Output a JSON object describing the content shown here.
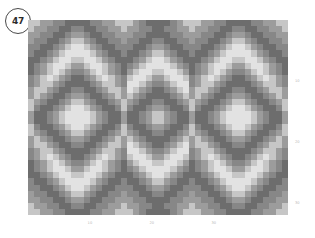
{
  "badge": {
    "label": "47",
    "name": "figure-number-badge"
  },
  "chart_data": {
    "type": "heatmap",
    "title": "",
    "xlabel": "",
    "ylabel": "",
    "grid": false,
    "legend": "none",
    "colormap": "grays",
    "ncols": 42,
    "nrows": 32,
    "xlim": [
      0,
      42
    ],
    "ylim": [
      0,
      32
    ],
    "xticks": [
      10,
      20,
      30
    ],
    "xticklabels": [
      "10",
      "20",
      "30"
    ],
    "yticks": [
      10,
      20,
      30
    ],
    "yticklabels": [
      "10",
      "20",
      "30"
    ],
    "ytick_position": "right",
    "value_levels": [
      0,
      1,
      2,
      3,
      4
    ],
    "level_colors": [
      "#6d6d6d",
      "#878787",
      "#9c9c9c",
      "#c6c6c6",
      "#e2e2e2"
    ],
    "values": [
      [
        3,
        3,
        2,
        2,
        1,
        1,
        0,
        0,
        0,
        0,
        1,
        1,
        2,
        2,
        3,
        3,
        3,
        2,
        1,
        0,
        0,
        0,
        0,
        1,
        2,
        3,
        3,
        3,
        2,
        2,
        1,
        1,
        0,
        0,
        0,
        0,
        1,
        1,
        2,
        2,
        3,
        3
      ],
      [
        3,
        2,
        2,
        1,
        1,
        0,
        0,
        1,
        1,
        0,
        0,
        1,
        1,
        2,
        2,
        3,
        2,
        2,
        1,
        1,
        0,
        0,
        1,
        1,
        2,
        2,
        3,
        2,
        2,
        1,
        1,
        0,
        0,
        1,
        1,
        0,
        0,
        1,
        1,
        2,
        2,
        3
      ],
      [
        2,
        2,
        1,
        1,
        0,
        0,
        1,
        2,
        2,
        1,
        0,
        0,
        1,
        1,
        2,
        2,
        2,
        1,
        1,
        0,
        0,
        0,
        0,
        1,
        1,
        2,
        2,
        2,
        1,
        1,
        0,
        0,
        1,
        2,
        2,
        1,
        0,
        0,
        1,
        1,
        2,
        2
      ],
      [
        2,
        1,
        1,
        0,
        0,
        1,
        2,
        3,
        3,
        2,
        1,
        0,
        0,
        1,
        1,
        2,
        1,
        1,
        0,
        0,
        1,
        1,
        0,
        0,
        1,
        1,
        2,
        1,
        1,
        0,
        0,
        1,
        2,
        3,
        3,
        2,
        1,
        0,
        0,
        1,
        1,
        2
      ],
      [
        1,
        1,
        0,
        0,
        1,
        2,
        3,
        4,
        4,
        3,
        2,
        1,
        0,
        0,
        1,
        1,
        1,
        0,
        0,
        1,
        2,
        2,
        1,
        0,
        0,
        1,
        1,
        1,
        0,
        0,
        1,
        2,
        3,
        4,
        4,
        3,
        2,
        1,
        0,
        0,
        1,
        1
      ],
      [
        1,
        0,
        0,
        1,
        2,
        3,
        4,
        4,
        4,
        4,
        3,
        2,
        1,
        0,
        0,
        1,
        0,
        0,
        1,
        2,
        3,
        3,
        2,
        1,
        0,
        0,
        1,
        0,
        0,
        1,
        2,
        3,
        4,
        4,
        4,
        4,
        3,
        2,
        1,
        0,
        0,
        1
      ],
      [
        0,
        0,
        1,
        2,
        3,
        4,
        4,
        3,
        3,
        4,
        4,
        3,
        2,
        1,
        0,
        0,
        0,
        1,
        2,
        3,
        4,
        4,
        3,
        2,
        1,
        0,
        0,
        0,
        1,
        2,
        3,
        4,
        4,
        3,
        3,
        4,
        4,
        3,
        2,
        1,
        0,
        0
      ],
      [
        0,
        1,
        2,
        3,
        4,
        4,
        3,
        2,
        2,
        3,
        4,
        4,
        3,
        2,
        1,
        0,
        1,
        2,
        3,
        4,
        4,
        4,
        4,
        3,
        2,
        1,
        0,
        1,
        2,
        3,
        4,
        4,
        3,
        2,
        2,
        3,
        4,
        4,
        3,
        2,
        1,
        0
      ],
      [
        0,
        1,
        2,
        3,
        4,
        3,
        2,
        1,
        1,
        2,
        3,
        4,
        3,
        2,
        1,
        0,
        2,
        3,
        4,
        4,
        3,
        3,
        4,
        4,
        3,
        2,
        0,
        1,
        2,
        3,
        4,
        3,
        2,
        1,
        1,
        2,
        3,
        4,
        3,
        2,
        1,
        0
      ],
      [
        1,
        2,
        3,
        4,
        3,
        2,
        1,
        0,
        0,
        1,
        2,
        3,
        4,
        3,
        2,
        1,
        3,
        4,
        4,
        3,
        2,
        2,
        3,
        4,
        4,
        3,
        1,
        2,
        3,
        4,
        3,
        2,
        1,
        0,
        0,
        1,
        2,
        3,
        4,
        3,
        2,
        1
      ],
      [
        1,
        2,
        3,
        3,
        2,
        1,
        0,
        0,
        0,
        0,
        1,
        2,
        3,
        3,
        2,
        1,
        4,
        4,
        3,
        2,
        1,
        1,
        2,
        3,
        4,
        4,
        1,
        2,
        3,
        3,
        2,
        1,
        0,
        0,
        0,
        0,
        1,
        2,
        3,
        3,
        2,
        1
      ],
      [
        2,
        3,
        3,
        2,
        1,
        0,
        0,
        1,
        1,
        0,
        0,
        1,
        2,
        3,
        3,
        2,
        4,
        3,
        2,
        1,
        0,
        0,
        1,
        2,
        3,
        4,
        2,
        3,
        3,
        2,
        1,
        0,
        0,
        1,
        1,
        0,
        0,
        1,
        2,
        3,
        3,
        2
      ],
      [
        2,
        3,
        2,
        1,
        0,
        0,
        1,
        2,
        2,
        1,
        0,
        0,
        1,
        2,
        3,
        2,
        3,
        2,
        1,
        0,
        0,
        0,
        0,
        1,
        2,
        3,
        2,
        3,
        2,
        1,
        0,
        0,
        1,
        2,
        2,
        1,
        0,
        0,
        1,
        2,
        3,
        2
      ],
      [
        3,
        2,
        1,
        0,
        0,
        1,
        2,
        3,
        3,
        2,
        1,
        0,
        0,
        1,
        2,
        3,
        2,
        1,
        0,
        0,
        1,
        1,
        0,
        0,
        1,
        2,
        3,
        2,
        1,
        0,
        0,
        1,
        2,
        3,
        3,
        2,
        1,
        0,
        0,
        1,
        2,
        3
      ],
      [
        3,
        1,
        0,
        0,
        1,
        2,
        3,
        4,
        4,
        3,
        2,
        1,
        0,
        0,
        1,
        3,
        1,
        0,
        0,
        1,
        2,
        2,
        1,
        0,
        0,
        1,
        3,
        1,
        0,
        0,
        1,
        2,
        3,
        4,
        4,
        3,
        2,
        1,
        0,
        0,
        1,
        3
      ],
      [
        2,
        0,
        0,
        1,
        2,
        3,
        4,
        4,
        4,
        4,
        3,
        2,
        1,
        0,
        0,
        2,
        0,
        0,
        1,
        2,
        3,
        3,
        2,
        1,
        0,
        0,
        2,
        0,
        0,
        1,
        2,
        3,
        4,
        4,
        4,
        4,
        3,
        2,
        1,
        0,
        0,
        2
      ],
      [
        2,
        0,
        0,
        1,
        2,
        3,
        4,
        4,
        4,
        4,
        3,
        2,
        1,
        0,
        0,
        2,
        0,
        0,
        1,
        2,
        3,
        3,
        2,
        1,
        0,
        0,
        2,
        0,
        0,
        1,
        2,
        3,
        4,
        4,
        4,
        4,
        3,
        2,
        1,
        0,
        0,
        2
      ],
      [
        3,
        1,
        0,
        0,
        1,
        2,
        3,
        4,
        4,
        3,
        2,
        1,
        0,
        0,
        1,
        3,
        1,
        0,
        0,
        1,
        2,
        2,
        1,
        0,
        0,
        1,
        3,
        1,
        0,
        0,
        1,
        2,
        3,
        4,
        4,
        3,
        2,
        1,
        0,
        0,
        1,
        3
      ],
      [
        3,
        2,
        1,
        0,
        0,
        1,
        2,
        3,
        3,
        2,
        1,
        0,
        0,
        1,
        2,
        3,
        2,
        1,
        0,
        0,
        1,
        1,
        0,
        0,
        1,
        2,
        3,
        2,
        1,
        0,
        0,
        1,
        2,
        3,
        3,
        2,
        1,
        0,
        0,
        1,
        2,
        3
      ],
      [
        2,
        3,
        2,
        1,
        0,
        0,
        1,
        2,
        2,
        1,
        0,
        0,
        1,
        2,
        3,
        2,
        3,
        2,
        1,
        0,
        0,
        0,
        0,
        1,
        2,
        3,
        2,
        3,
        2,
        1,
        0,
        0,
        1,
        2,
        2,
        1,
        0,
        0,
        1,
        2,
        3,
        2
      ],
      [
        2,
        3,
        3,
        2,
        1,
        0,
        0,
        1,
        1,
        0,
        0,
        1,
        2,
        3,
        3,
        2,
        4,
        3,
        2,
        1,
        0,
        0,
        1,
        2,
        3,
        4,
        2,
        3,
        3,
        2,
        1,
        0,
        0,
        1,
        1,
        0,
        0,
        1,
        2,
        3,
        3,
        2
      ],
      [
        1,
        2,
        3,
        3,
        2,
        1,
        0,
        0,
        0,
        0,
        1,
        2,
        3,
        3,
        2,
        1,
        4,
        4,
        3,
        2,
        1,
        1,
        2,
        3,
        4,
        4,
        1,
        2,
        3,
        3,
        2,
        1,
        0,
        0,
        0,
        0,
        1,
        2,
        3,
        3,
        2,
        1
      ],
      [
        1,
        2,
        3,
        4,
        3,
        2,
        1,
        0,
        0,
        1,
        2,
        3,
        4,
        3,
        2,
        1,
        3,
        4,
        4,
        3,
        2,
        2,
        3,
        4,
        4,
        3,
        1,
        2,
        3,
        4,
        3,
        2,
        1,
        0,
        0,
        1,
        2,
        3,
        4,
        3,
        2,
        1
      ],
      [
        0,
        1,
        2,
        3,
        4,
        3,
        2,
        1,
        1,
        2,
        3,
        4,
        3,
        2,
        1,
        0,
        2,
        3,
        4,
        4,
        3,
        3,
        4,
        4,
        3,
        2,
        0,
        1,
        2,
        3,
        4,
        3,
        2,
        1,
        1,
        2,
        3,
        4,
        3,
        2,
        1,
        0
      ],
      [
        0,
        1,
        2,
        3,
        4,
        4,
        3,
        2,
        2,
        3,
        4,
        4,
        3,
        2,
        1,
        0,
        1,
        2,
        3,
        4,
        4,
        4,
        4,
        3,
        2,
        1,
        0,
        1,
        2,
        3,
        4,
        4,
        3,
        2,
        2,
        3,
        4,
        4,
        3,
        2,
        1,
        0
      ],
      [
        0,
        0,
        1,
        2,
        3,
        4,
        4,
        3,
        3,
        4,
        4,
        3,
        2,
        1,
        0,
        0,
        0,
        1,
        2,
        3,
        4,
        4,
        3,
        2,
        1,
        0,
        0,
        0,
        1,
        2,
        3,
        4,
        4,
        3,
        3,
        4,
        4,
        3,
        2,
        1,
        0,
        0
      ],
      [
        1,
        0,
        0,
        1,
        2,
        3,
        4,
        4,
        4,
        4,
        3,
        2,
        1,
        0,
        0,
        1,
        0,
        0,
        1,
        2,
        3,
        3,
        2,
        1,
        0,
        0,
        1,
        0,
        0,
        1,
        2,
        3,
        4,
        4,
        4,
        4,
        3,
        2,
        1,
        0,
        0,
        1
      ],
      [
        1,
        1,
        0,
        0,
        1,
        2,
        3,
        4,
        4,
        3,
        2,
        1,
        0,
        0,
        1,
        1,
        1,
        0,
        0,
        1,
        2,
        2,
        1,
        0,
        0,
        1,
        1,
        1,
        0,
        0,
        1,
        2,
        3,
        4,
        4,
        3,
        2,
        1,
        0,
        0,
        1,
        1
      ],
      [
        2,
        1,
        1,
        0,
        0,
        1,
        2,
        3,
        3,
        2,
        1,
        0,
        0,
        1,
        1,
        2,
        1,
        1,
        0,
        0,
        1,
        1,
        0,
        0,
        1,
        1,
        2,
        1,
        1,
        0,
        0,
        1,
        2,
        3,
        3,
        2,
        1,
        0,
        0,
        1,
        1,
        2
      ],
      [
        2,
        2,
        1,
        1,
        0,
        0,
        1,
        2,
        2,
        1,
        0,
        0,
        1,
        1,
        2,
        2,
        2,
        1,
        1,
        0,
        0,
        0,
        0,
        1,
        1,
        2,
        2,
        2,
        1,
        1,
        0,
        0,
        1,
        2,
        2,
        1,
        0,
        0,
        1,
        1,
        2,
        2
      ],
      [
        3,
        2,
        2,
        1,
        1,
        0,
        0,
        1,
        1,
        0,
        0,
        1,
        1,
        2,
        2,
        3,
        2,
        2,
        1,
        1,
        0,
        0,
        1,
        1,
        2,
        2,
        3,
        2,
        2,
        1,
        1,
        0,
        0,
        1,
        1,
        0,
        0,
        1,
        1,
        2,
        2,
        3
      ],
      [
        3,
        3,
        2,
        2,
        1,
        1,
        0,
        0,
        0,
        0,
        1,
        1,
        2,
        2,
        3,
        3,
        3,
        2,
        1,
        0,
        0,
        0,
        0,
        1,
        2,
        3,
        3,
        3,
        2,
        2,
        1,
        1,
        0,
        0,
        0,
        0,
        1,
        1,
        2,
        2,
        3,
        3
      ]
    ]
  }
}
